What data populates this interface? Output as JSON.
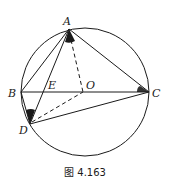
{
  "figure": {
    "caption": "图 4.163",
    "stroke_color": "#1a1a1a",
    "circle": {
      "center": "O",
      "cx": 85,
      "cy": 92,
      "r": 64
    },
    "points": {
      "A": {
        "label": "A",
        "x": 69,
        "y": 29
      },
      "B": {
        "label": "B",
        "x": 21,
        "y": 92
      },
      "C": {
        "label": "C",
        "x": 149,
        "y": 92
      },
      "D": {
        "label": "D",
        "x": 30,
        "y": 124
      },
      "E": {
        "label": "E",
        "x": 43,
        "y": 92
      },
      "O": {
        "label": "O",
        "x": 83,
        "y": 92
      }
    },
    "segments_solid": [
      "AB",
      "AC",
      "AD",
      "BC",
      "DC"
    ],
    "segments_dashed": [
      "AO",
      "DO"
    ],
    "marked_angles": [
      "∠BAD / ∠OAD at A",
      "∠ACB at C",
      "∠ADB at D"
    ]
  }
}
